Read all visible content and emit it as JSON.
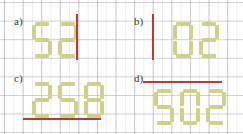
{
  "sheet": {
    "title": "seven-segment-digit-worksheet",
    "grid_color": "#9a9aa4",
    "digit_color": "#cfd18a",
    "line_color": "#c0392f",
    "background": "#ffffff"
  },
  "panels": [
    {
      "id": "a",
      "label": "a)",
      "value": "52",
      "digits": [
        "5",
        "2"
      ],
      "line": {
        "orientation": "vertical",
        "position": "right-of-digits"
      }
    },
    {
      "id": "b",
      "label": "b)",
      "value": "02",
      "digits": [
        "0",
        "2"
      ],
      "line": {
        "orientation": "vertical",
        "position": "left-of-digits"
      }
    },
    {
      "id": "c",
      "label": "c)",
      "value": "258",
      "digits": [
        "2",
        "5",
        "8"
      ],
      "line": {
        "orientation": "horizontal",
        "position": "below-digits"
      }
    },
    {
      "id": "d",
      "label": "d)",
      "value": "502",
      "digits": [
        "5",
        "0",
        "2"
      ],
      "line": {
        "orientation": "horizontal",
        "position": "above-digits"
      }
    }
  ],
  "segment_map": {
    "0": [
      "a",
      "b",
      "c",
      "d",
      "e",
      "f"
    ],
    "2": [
      "a",
      "b",
      "g",
      "e",
      "d"
    ],
    "5": [
      "a",
      "f",
      "g",
      "c",
      "d"
    ],
    "8": [
      "a",
      "b",
      "c",
      "d",
      "e",
      "f",
      "g"
    ]
  }
}
